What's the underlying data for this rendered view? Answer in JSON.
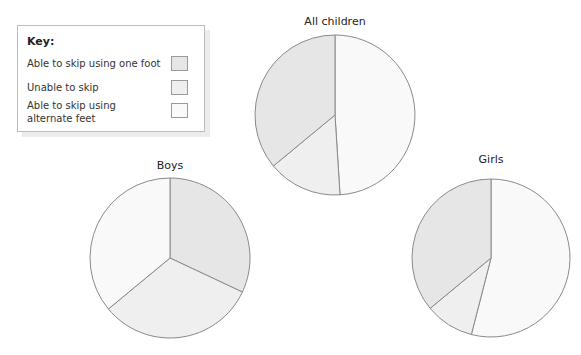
{
  "chart_data": [
    {
      "type": "pie",
      "title": "All children",
      "categories": [
        "Able to skip using alternate feet",
        "Unable to skip",
        "Able to skip using one foot"
      ],
      "values": [
        49,
        15,
        36
      ],
      "center": [
        335,
        115
      ],
      "radius": 80
    },
    {
      "type": "pie",
      "title": "Boys",
      "categories": [
        "Able to skip using one foot",
        "Unable to skip",
        "Able to skip using alternate feet"
      ],
      "values": [
        32,
        32,
        36
      ],
      "center": [
        170,
        258
      ],
      "radius": 80
    },
    {
      "type": "pie",
      "title": "Girls",
      "categories": [
        "Able to skip using alternate feet",
        "Unable to skip",
        "Able to skip using one foot"
      ],
      "values": [
        54,
        10,
        36
      ],
      "center": [
        491,
        258
      ],
      "radius": 79
    }
  ],
  "key": {
    "title": "Key:",
    "items": [
      {
        "label": "Able to skip using one foot",
        "color": "#e6e6e6"
      },
      {
        "label": "Unable to skip",
        "color": "#efefef"
      },
      {
        "label_line1": "Able to skip using",
        "label_line2": "alternate feet",
        "color": "#f9f9f9"
      }
    ]
  },
  "colors": {
    "Able to skip using one foot": "#e6e6e6",
    "Unable to skip": "#efefef",
    "Able to skip using alternate feet": "#f9f9f9",
    "stroke": "#8a8a8a"
  },
  "titles": {
    "all": "All children",
    "boys": "Boys",
    "girls": "Girls"
  }
}
